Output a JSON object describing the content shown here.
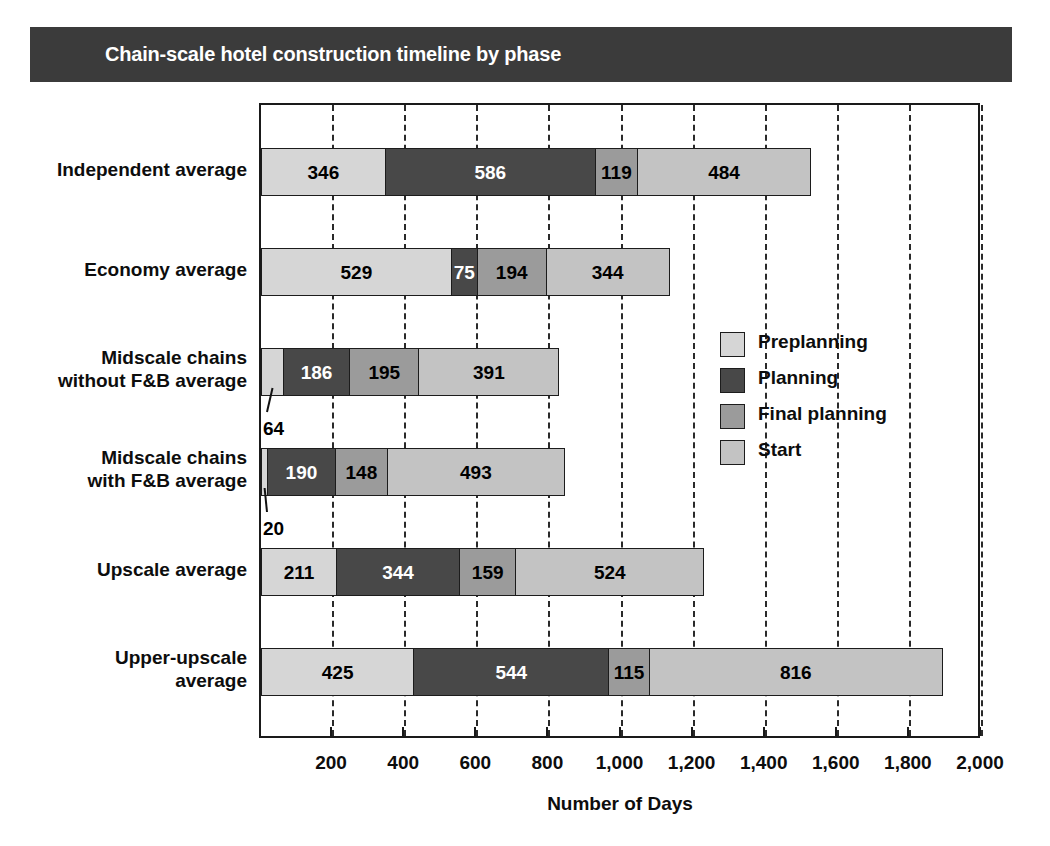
{
  "title": {
    "text": "Chain-scale hotel construction timeline by phase",
    "bar_color": "#3b3b3b",
    "text_color": "#ffffff"
  },
  "chart_data": {
    "type": "bar",
    "orientation": "horizontal",
    "stacked": true,
    "title": "Chain-scale hotel construction timeline by phase",
    "xlabel": "Number of Days",
    "ylabel": "",
    "xlim": [
      0,
      2000
    ],
    "xticks": [
      200,
      400,
      600,
      800,
      1000,
      1200,
      1400,
      1600,
      1800,
      2000
    ],
    "xticklabels": [
      "200",
      "400",
      "600",
      "800",
      "1,000",
      "1,200",
      "1,400",
      "1,600",
      "1,800",
      "2,000"
    ],
    "grid": "vertical-dashed",
    "legend_position": "inside-right",
    "categories": [
      "Independent average",
      "Economy average",
      "Midscale chains without F&B average",
      "Midscale chains with F&B average",
      "Upscale average",
      "Upper-upscale average"
    ],
    "category_lines": [
      [
        "Independent average"
      ],
      [
        "Economy average"
      ],
      [
        "Midscale chains",
        "without F&B average"
      ],
      [
        "Midscale chains",
        "with F&B average"
      ],
      [
        "Upscale average"
      ],
      [
        "Upper-upscale",
        "average"
      ]
    ],
    "series": [
      {
        "name": "Preplanning",
        "color": "#d6d6d6",
        "values": [
          346,
          529,
          64,
          20,
          211,
          425
        ]
      },
      {
        "name": "Planning",
        "color": "#484848",
        "values": [
          586,
          75,
          186,
          190,
          344,
          544
        ]
      },
      {
        "name": "Final planning",
        "color": "#9b9b9b",
        "values": [
          119,
          194,
          195,
          148,
          159,
          115
        ]
      },
      {
        "name": "Start",
        "color": "#c3c3c3",
        "values": [
          484,
          344,
          391,
          493,
          524,
          816
        ]
      }
    ],
    "totals": [
      1535,
      1142,
      836,
      851,
      1238,
      1900
    ],
    "label_text_colors": [
      [
        "dark",
        "light",
        "dark",
        "dark"
      ],
      [
        "dark",
        "light",
        "dark",
        "dark"
      ],
      [
        "callout",
        "light",
        "dark",
        "dark"
      ],
      [
        "callout",
        "light",
        "dark",
        "dark"
      ],
      [
        "dark",
        "light",
        "dark",
        "dark"
      ],
      [
        "dark",
        "light",
        "dark",
        "dark"
      ]
    ],
    "callouts": [
      {
        "value": "64",
        "row": 2,
        "series": "Preplanning"
      },
      {
        "value": "20",
        "row": 3,
        "series": "Preplanning"
      }
    ]
  },
  "legend": {
    "items": [
      {
        "label": "Preplanning",
        "color": "#d6d6d6"
      },
      {
        "label": "Planning",
        "color": "#484848"
      },
      {
        "label": "Final planning",
        "color": "#9b9b9b"
      },
      {
        "label": "Start",
        "color": "#c3c3c3"
      }
    ]
  },
  "axis": {
    "x_title": "Number of Days"
  }
}
